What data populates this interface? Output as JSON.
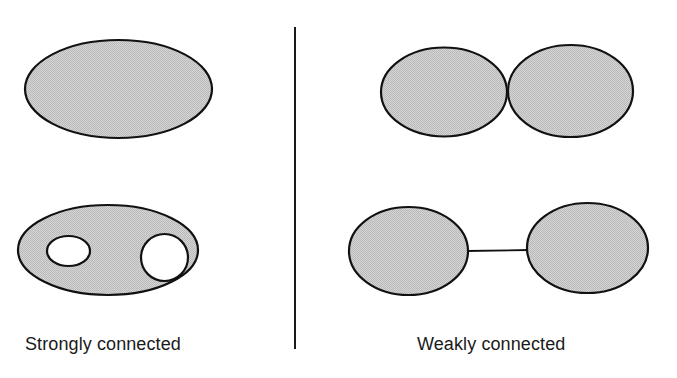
{
  "figure": {
    "background_color": "#ffffff",
    "stroke_color": "#111111",
    "fill_color": "#cccccc",
    "divider": {
      "name": "vertical-divider",
      "x": 295,
      "y_top": 27,
      "y_bottom": 349,
      "width": 2,
      "color": "#1a1a1a"
    },
    "panels": [
      {
        "id": "left-panel",
        "caption": "Strongly connected",
        "caption_x": 25,
        "caption_y": 334,
        "shapes": [
          {
            "name": "single-filled-ellipse",
            "type": "ellipse",
            "cx": 118.5,
            "cy": 89,
            "rx": 93.5,
            "ry": 49
          },
          {
            "name": "ellipse-with-two-holes",
            "type": "ellipse-with-holes",
            "cx": 108,
            "cy": 250,
            "rx": 90,
            "ry": 45,
            "holes": [
              {
                "name": "hole-left-ellipse",
                "cx": 68.5,
                "cy": 251,
                "rx": 21.5,
                "ry": 15
              },
              {
                "name": "hole-right-circle",
                "cx": 164.5,
                "cy": 257.5,
                "rx": 23.5,
                "ry": 23.5
              }
            ]
          }
        ]
      },
      {
        "id": "right-panel",
        "caption": "Weakly connected",
        "caption_x": 417,
        "caption_y": 334,
        "shapes": [
          {
            "name": "tangent-ellipse-left",
            "type": "ellipse",
            "cx": 444,
            "cy": 92,
            "rx": 63,
            "ry": 44.5
          },
          {
            "name": "tangent-ellipse-right",
            "type": "ellipse",
            "cx": 570.5,
            "cy": 91,
            "rx": 62.5,
            "ry": 46
          },
          {
            "name": "linked-ellipse-left",
            "type": "ellipse",
            "cx": 408.5,
            "cy": 251,
            "rx": 59.5,
            "ry": 44
          },
          {
            "name": "linked-ellipse-right",
            "type": "ellipse",
            "cx": 587.5,
            "cy": 248,
            "rx": 60.5,
            "ry": 45
          },
          {
            "name": "connector-line",
            "type": "line",
            "x1": 468,
            "y1": 251,
            "x2": 527,
            "y2": 250
          }
        ]
      }
    ]
  },
  "captions": {
    "left": "Strongly connected",
    "right": "Weakly connected"
  }
}
